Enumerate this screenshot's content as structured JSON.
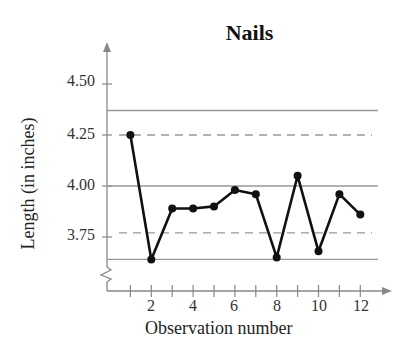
{
  "chart_data": {
    "type": "line",
    "title": "Nails",
    "xlabel": "Observation number",
    "ylabel": "Length (in inches)",
    "x": [
      1,
      2,
      3,
      4,
      5,
      6,
      7,
      8,
      9,
      10,
      11,
      12
    ],
    "series": [
      {
        "name": "Length",
        "values": [
          4.25,
          3.64,
          3.89,
          3.89,
          3.9,
          3.98,
          3.96,
          3.65,
          4.05,
          3.68,
          3.96,
          3.86
        ]
      }
    ],
    "reference_lines": [
      {
        "name": "Upper control limit",
        "style": "solid",
        "value": 4.37
      },
      {
        "name": "Upper dashed line",
        "style": "dashed",
        "value": 4.25
      },
      {
        "name": "Center line",
        "style": "solid",
        "value": 4.0
      },
      {
        "name": "Lower dashed line",
        "style": "dashed",
        "value": 3.77
      },
      {
        "name": "Lower control limit",
        "style": "solid",
        "value": 3.64
      }
    ],
    "y_ticks": [
      "3.75",
      "4.00",
      "4.25",
      "4.50"
    ],
    "x_ticks": [
      "2",
      "4",
      "6",
      "8",
      "10",
      "12"
    ],
    "ylim": [
      3.5,
      4.6
    ],
    "xlim": [
      0,
      13
    ],
    "y_axis_break": true,
    "grid": false,
    "legend": null
  }
}
